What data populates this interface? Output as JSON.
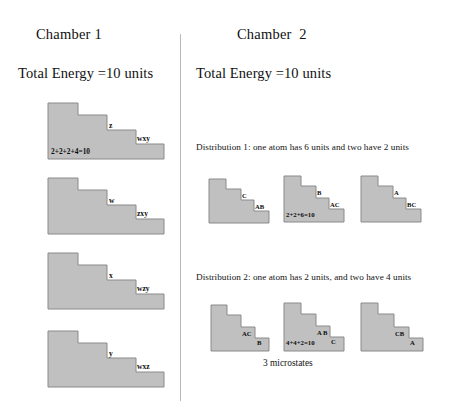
{
  "canvas": {
    "width": 449,
    "height": 415,
    "background": "#ffffff"
  },
  "style": {
    "step_fill": "#c0c0c0",
    "step_stroke": "#8a8a8a",
    "divider_color": "#b9b9b9",
    "text_color": "#111111"
  },
  "chamber1": {
    "title": "Chamber 1",
    "energy": "Total Energy =10 units",
    "figures": [
      {
        "id": "c1-fig-1",
        "top_label": "z",
        "step_label": "wxy",
        "sum_label": "2+2+2+4=10",
        "steps": 4
      },
      {
        "id": "c1-fig-2",
        "top_label": "w",
        "step_label": "zxy",
        "sum_label": "",
        "steps": 4
      },
      {
        "id": "c1-fig-3",
        "top_label": "x",
        "step_label": "wzy",
        "sum_label": "",
        "steps": 4
      },
      {
        "id": "c1-fig-4",
        "top_label": "y",
        "step_label": "wxz",
        "sum_label": "",
        "steps": 4
      }
    ]
  },
  "chamber2": {
    "title": "Chamber  2",
    "energy": "Total Energy =10 units",
    "distribution1": {
      "caption": "Distribution 1: one atom has 6 units and two have 2 units",
      "figures": [
        {
          "id": "d1-fig-1",
          "top_label": "C",
          "step_label": "AB",
          "sum_label": ""
        },
        {
          "id": "d1-fig-2",
          "top_label": "B",
          "step_label": "AC",
          "sum_label": "2+2+6=10"
        },
        {
          "id": "d1-fig-3",
          "top_label": "A",
          "step_label": "BC",
          "sum_label": ""
        }
      ]
    },
    "distribution2": {
      "caption": "Distribution 2: one atom has 2 units, and two have 4 units",
      "figures": [
        {
          "id": "d2-fig-1",
          "top_label": "AC",
          "step_label": "B",
          "sum_label": ""
        },
        {
          "id": "d2-fig-2",
          "top_label": "A B",
          "step_label": "C",
          "sum_label": "4+4+2=10"
        },
        {
          "id": "d2-fig-3",
          "top_label": "CB",
          "step_label": "A",
          "sum_label": ""
        }
      ],
      "footer": "3 microstates"
    }
  }
}
